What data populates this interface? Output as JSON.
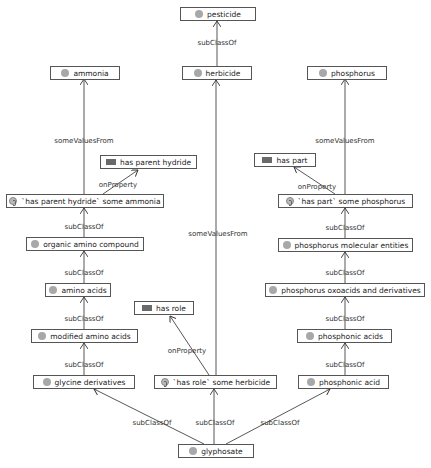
{
  "diagram": {
    "nodes": [
      {
        "id": "pesticide",
        "label": "pesticide",
        "type": "class"
      },
      {
        "id": "ammonia",
        "label": "ammonia",
        "type": "class"
      },
      {
        "id": "herbicide",
        "label": "herbicide",
        "type": "class"
      },
      {
        "id": "phosphorus",
        "label": "phosphorus",
        "type": "class"
      },
      {
        "id": "has_parent_hydride",
        "label": "has parent hydride",
        "type": "property"
      },
      {
        "id": "has_part",
        "label": "has part",
        "type": "property"
      },
      {
        "id": "hph_some_ammonia",
        "label": "`has parent hydride` some ammonia",
        "type": "restriction"
      },
      {
        "id": "hp_some_phosphorus",
        "label": "`has part` some phosphorus",
        "type": "restriction"
      },
      {
        "id": "organic_amino_compound",
        "label": "organic amino compound",
        "type": "class"
      },
      {
        "id": "phosphorus_molecular_entities",
        "label": "phosphorus molecular entities",
        "type": "class"
      },
      {
        "id": "amino_acids",
        "label": "amino acids",
        "type": "class"
      },
      {
        "id": "phosphorus_oxoacids",
        "label": "phosphorus oxoacids and derivatives",
        "type": "class"
      },
      {
        "id": "has_role",
        "label": "has role",
        "type": "property"
      },
      {
        "id": "modified_amino_acids",
        "label": "modified amino acids",
        "type": "class"
      },
      {
        "id": "phosphonic_acids",
        "label": "phosphonic acids",
        "type": "class"
      },
      {
        "id": "glycine_derivatives",
        "label": "glycine derivatives",
        "type": "class"
      },
      {
        "id": "hr_some_herbicide",
        "label": "`has role` some herbicide",
        "type": "restriction"
      },
      {
        "id": "phosphonic_acid",
        "label": "phosphonic acid",
        "type": "class"
      },
      {
        "id": "glyphosate",
        "label": "glyphosate",
        "type": "class"
      }
    ],
    "edge_labels": {
      "subclass": "subClassOf",
      "some_values": "someValuesFrom",
      "on_property": "onProperty"
    },
    "edges": [
      {
        "from": "herbicide",
        "to": "pesticide",
        "label": "subClassOf"
      },
      {
        "from": "hph_some_ammonia",
        "to": "ammonia",
        "label": "someValuesFrom"
      },
      {
        "from": "hph_some_ammonia",
        "to": "has_parent_hydride",
        "label": "onProperty"
      },
      {
        "from": "organic_amino_compound",
        "to": "hph_some_ammonia",
        "label": "subClassOf"
      },
      {
        "from": "amino_acids",
        "to": "organic_amino_compound",
        "label": "subClassOf"
      },
      {
        "from": "modified_amino_acids",
        "to": "amino_acids",
        "label": "subClassOf"
      },
      {
        "from": "glycine_derivatives",
        "to": "modified_amino_acids",
        "label": "subClassOf"
      },
      {
        "from": "hr_some_herbicide",
        "to": "herbicide",
        "label": "someValuesFrom"
      },
      {
        "from": "hr_some_herbicide",
        "to": "has_role",
        "label": "onProperty"
      },
      {
        "from": "hp_some_phosphorus",
        "to": "phosphorus",
        "label": "someValuesFrom"
      },
      {
        "from": "hp_some_phosphorus",
        "to": "has_part",
        "label": "onProperty"
      },
      {
        "from": "phosphorus_molecular_entities",
        "to": "hp_some_phosphorus",
        "label": "subClassOf"
      },
      {
        "from": "phosphorus_oxoacids",
        "to": "phosphorus_molecular_entities",
        "label": "subClassOf"
      },
      {
        "from": "phosphonic_acids",
        "to": "phosphorus_oxoacids",
        "label": "subClassOf"
      },
      {
        "from": "phosphonic_acid",
        "to": "phosphonic_acids",
        "label": "subClassOf"
      },
      {
        "from": "glyphosate",
        "to": "glycine_derivatives",
        "label": "subClassOf"
      },
      {
        "from": "glyphosate",
        "to": "hr_some_herbicide",
        "label": "subClassOf"
      },
      {
        "from": "glyphosate",
        "to": "phosphonic_acid",
        "label": "subClassOf"
      }
    ]
  }
}
